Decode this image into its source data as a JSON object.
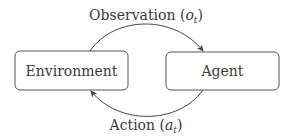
{
  "diagram": {
    "nodes": [
      {
        "id": "environment",
        "label": "Environment"
      },
      {
        "id": "agent",
        "label": "Agent"
      }
    ],
    "edges": [
      {
        "from": "environment",
        "to": "agent",
        "label": "Observation",
        "symbol": "o",
        "subscript": "t"
      },
      {
        "from": "agent",
        "to": "environment",
        "label": "Action",
        "symbol": "a",
        "subscript": "t"
      }
    ],
    "colors": {
      "stroke": "#555555",
      "text": "#3a3a3a",
      "background": "#ffffff"
    }
  }
}
